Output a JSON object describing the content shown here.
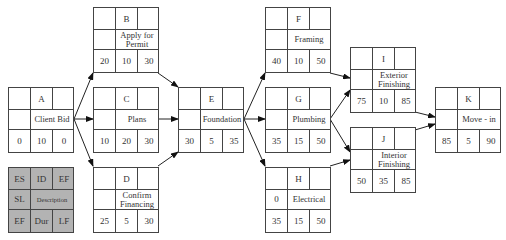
{
  "diagram": {
    "type": "activity-on-node network",
    "nodes": [
      {
        "id": "A",
        "description": "Client Bid",
        "sl": "",
        "es": "0",
        "dur": "10",
        "ef": "0"
      },
      {
        "id": "B",
        "description": "Apply for\nPermit",
        "sl": "",
        "es": "20",
        "dur": "10",
        "ef": "30"
      },
      {
        "id": "C",
        "description": "Plans",
        "sl": "",
        "es": "10",
        "dur": "20",
        "ef": "30"
      },
      {
        "id": "D",
        "description": "Confirm\nFinancing",
        "sl": "",
        "es": "25",
        "dur": "5",
        "ef": "30"
      },
      {
        "id": "E",
        "description": "Foundation",
        "sl": "",
        "es": "30",
        "dur": "5",
        "ef": "35"
      },
      {
        "id": "F",
        "description": "Framing",
        "sl": "",
        "es": "40",
        "dur": "10",
        "ef": "50"
      },
      {
        "id": "G",
        "description": "Plumbing",
        "sl": "",
        "es": "35",
        "dur": "15",
        "ef": "50"
      },
      {
        "id": "H",
        "description": "Electrical",
        "sl": "0",
        "es": "35",
        "dur": "15",
        "ef": "50"
      },
      {
        "id": "I",
        "description": "Exterior\nFinishing",
        "sl": "",
        "es": "75",
        "dur": "10",
        "ef": "85"
      },
      {
        "id": "J",
        "description": "Interior\nFinishing",
        "sl": "",
        "es": "50",
        "dur": "35",
        "ef": "85"
      },
      {
        "id": "K",
        "description": "Move - in",
        "sl": "",
        "es": "85",
        "dur": "5",
        "ef": "90"
      }
    ],
    "edges": [
      [
        "A",
        "B"
      ],
      [
        "A",
        "C"
      ],
      [
        "A",
        "D"
      ],
      [
        "B",
        "E"
      ],
      [
        "C",
        "E"
      ],
      [
        "D",
        "E"
      ],
      [
        "E",
        "F"
      ],
      [
        "E",
        "G"
      ],
      [
        "E",
        "H"
      ],
      [
        "F",
        "I"
      ],
      [
        "G",
        "I"
      ],
      [
        "G",
        "J"
      ],
      [
        "H",
        "J"
      ],
      [
        "I",
        "K"
      ],
      [
        "J",
        "K"
      ]
    ],
    "legend": {
      "top": [
        "ES",
        "ID",
        "EF"
      ],
      "middle": [
        "SL",
        "Description"
      ],
      "bottom": [
        "EF",
        "Dur",
        "LF"
      ]
    }
  }
}
